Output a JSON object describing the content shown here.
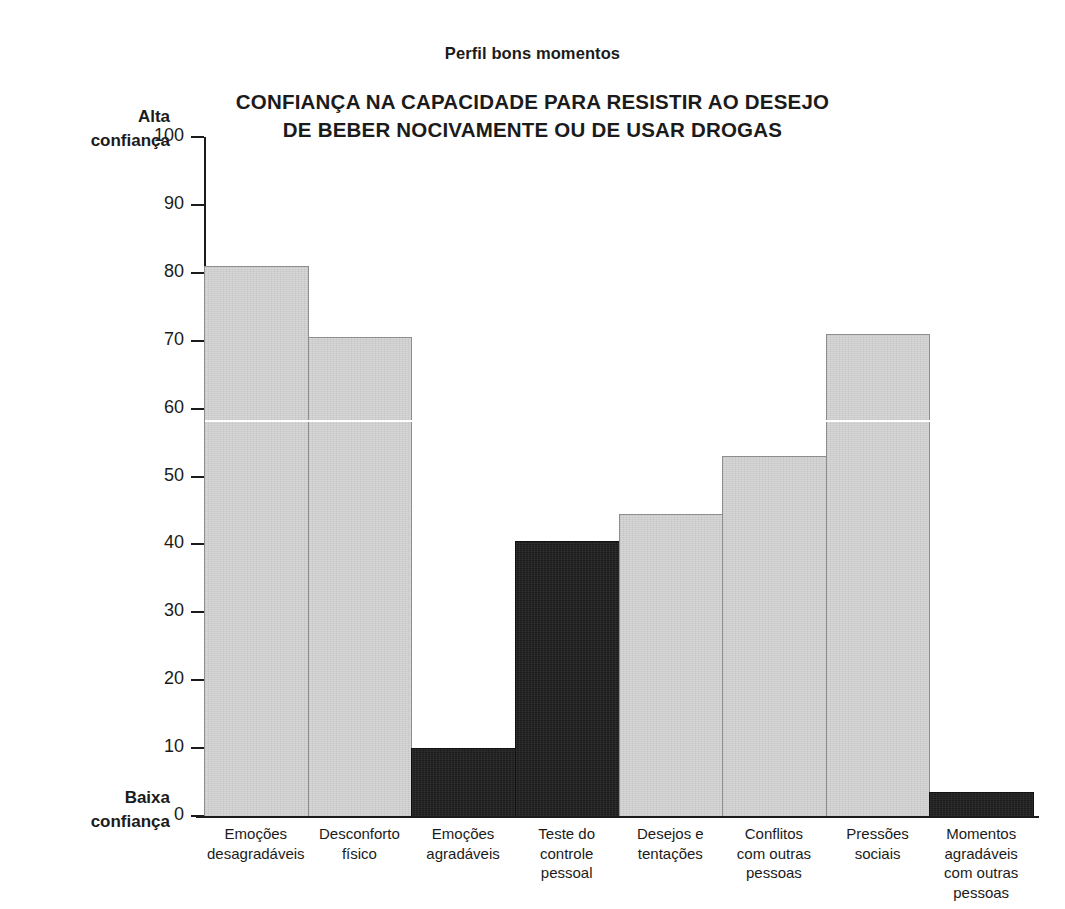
{
  "page": {
    "scan_artifact_top": "......"
  },
  "header": {
    "subtitle": "Perfil bons momentos",
    "title_line1": "CONFIANÇA NA CAPACIDADE PARA RESISTIR AO DESEJO",
    "title_line2": "DE BEBER NOCIVAMENTE OU DE USAR DROGAS"
  },
  "axis": {
    "high_caption_line1": "Alta",
    "high_caption_line2": "confiança",
    "low_caption_line1": "Baixa",
    "low_caption_line2": "confiança"
  },
  "colors": {
    "bar_light": "#d7d7d7",
    "bar_dark": "#1c1c1c",
    "axis": "#1b1b1b",
    "text": "#1b1b1b",
    "background": "#ffffff"
  },
  "chart_data": {
    "type": "bar",
    "title": "CONFIANÇA NA CAPACIDADE PARA RESISTIR AO DESEJO DE BEBER NOCIVAMENTE OU DE USAR DROGAS",
    "subtitle": "Perfil bons momentos",
    "xlabel": "",
    "ylabel": "",
    "ylim": [
      0,
      100
    ],
    "yticks": [
      0,
      10,
      20,
      30,
      40,
      50,
      60,
      70,
      80,
      90,
      100
    ],
    "ytick_labels": [
      "0",
      "10",
      "20",
      "30",
      "40",
      "50",
      "60",
      "70",
      "80",
      "90",
      "100"
    ],
    "y_axis_high_label": "Alta confiança",
    "y_axis_low_label": "Baixa confiança",
    "grid": false,
    "legend": null,
    "categories": [
      "Emoções desagradáveis",
      "Desconforto físico",
      "Emoções agradáveis",
      "Teste do controle pessoal",
      "Desejos e tentações",
      "Conflitos com outras pessoas",
      "Pressões sociais",
      "Momentos agradáveis com outras pessoas"
    ],
    "category_lines": [
      [
        "Emoções",
        "desagradáveis"
      ],
      [
        "Desconforto",
        "físico"
      ],
      [
        "Emoções",
        "agradáveis"
      ],
      [
        "Teste do",
        "controle",
        "pessoal"
      ],
      [
        "Desejos e",
        "tentações"
      ],
      [
        "Conflitos",
        "com outras",
        "pessoas"
      ],
      [
        "Pressões",
        "sociais"
      ],
      [
        "Momentos",
        "agradáveis",
        "com outras",
        "pessoas"
      ]
    ],
    "values": [
      81,
      70.5,
      10,
      40.5,
      44.5,
      53,
      71,
      3.5
    ],
    "bar_colors": [
      "#d7d7d7",
      "#d7d7d7",
      "#1c1c1c",
      "#1c1c1c",
      "#d7d7d7",
      "#d7d7d7",
      "#d7d7d7",
      "#1c1c1c"
    ]
  }
}
